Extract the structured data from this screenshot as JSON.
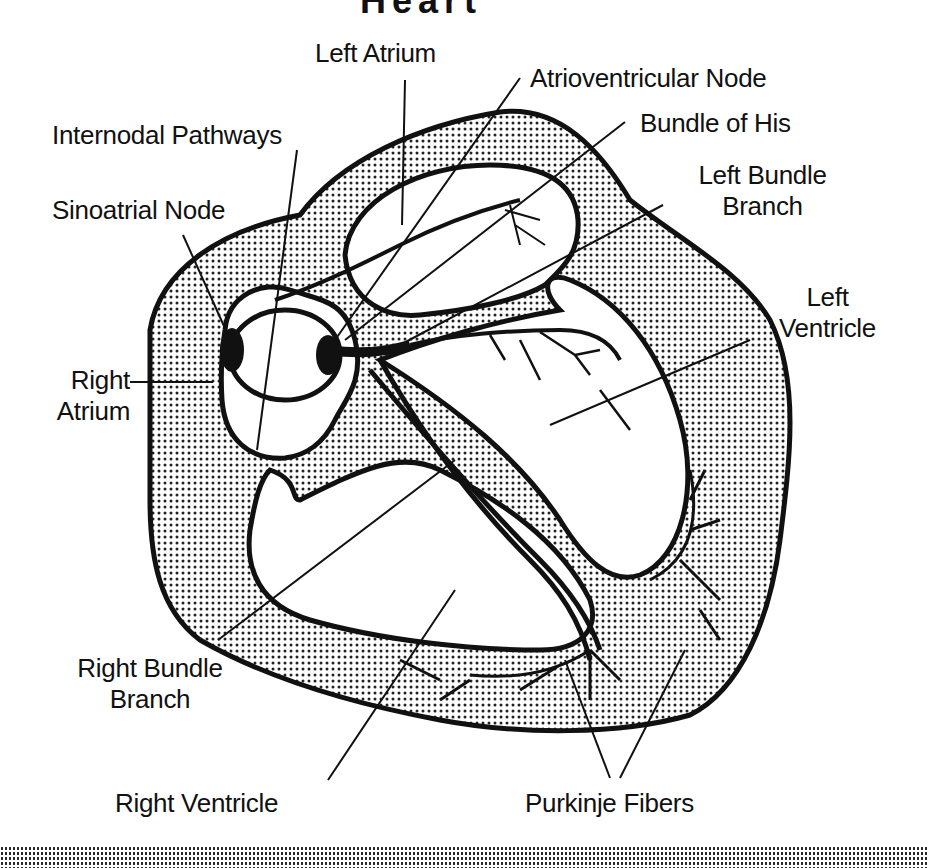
{
  "figure": {
    "title_fragment": "Heart",
    "colors": {
      "ink": "#111111",
      "background": "#ffffff",
      "stipple": "#222222"
    }
  },
  "labels": {
    "left_atrium": "Left Atrium",
    "atrioventricular_node": "Atrioventricular Node",
    "internodal_pathways": "Internodal Pathways",
    "bundle_of_his": "Bundle of His",
    "sinoatrial_node": "Sinoatrial Node",
    "left_bundle_branch_line1": "Left Bundle",
    "left_bundle_branch_line2": "Branch",
    "left_ventricle_line1": "Left",
    "left_ventricle_line2": "Ventricle",
    "right_atrium_line1": "Right",
    "right_atrium_line2": "Atrium",
    "right_bundle_branch_line1": "Right Bundle",
    "right_bundle_branch_line2": "Branch",
    "right_ventricle": "Right Ventricle",
    "purkinje_fibers": "Purkinje Fibers"
  }
}
